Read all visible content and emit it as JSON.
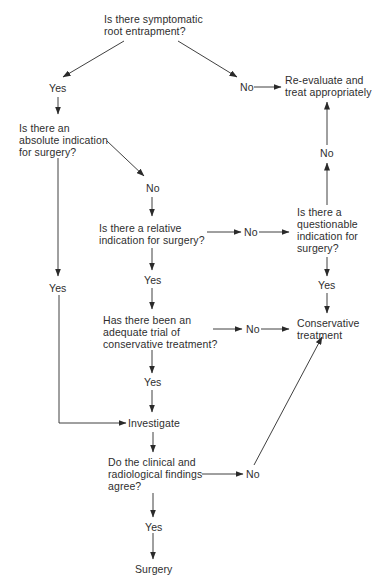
{
  "diagram": {
    "type": "flowchart",
    "nodes": {
      "q_root": {
        "lines": [
          "Is there symptomatic",
          "root entrapment?"
        ]
      },
      "yes_1": {
        "text": "Yes"
      },
      "no_1": {
        "text": "No"
      },
      "reevaluate": {
        "lines": [
          "Re-evaluate and",
          "treat appropriately"
        ]
      },
      "q_absolute": {
        "lines": [
          "Is there an",
          "absolute indication",
          "for surgery?"
        ]
      },
      "no_2": {
        "text": "No"
      },
      "yes_abs": {
        "text": "Yes"
      },
      "q_relative": {
        "lines": [
          "Is there a relative",
          "indication for surgery?"
        ]
      },
      "no_3": {
        "text": "No"
      },
      "q_questionable": {
        "lines": [
          "Is there a",
          "questionable",
          "indication for",
          "surgery?"
        ]
      },
      "no_q": {
        "text": "No"
      },
      "yes_q": {
        "text": "Yes"
      },
      "yes_rel": {
        "text": "Yes"
      },
      "q_trial": {
        "lines": [
          "Has there been an",
          "adequate trial of",
          "conservative treatment?"
        ]
      },
      "no_4": {
        "text": "No"
      },
      "conservative": {
        "lines": [
          "Conservative",
          "treatment"
        ]
      },
      "yes_trial": {
        "text": "Yes"
      },
      "investigate": {
        "text": "Investigate"
      },
      "q_agree": {
        "lines": [
          "Do the clinical and",
          "radiological findings",
          "agree?"
        ]
      },
      "no_5": {
        "text": "No"
      },
      "yes_agree": {
        "text": "Yes"
      },
      "surgery": {
        "text": "Surgery"
      }
    },
    "edges": [
      [
        "q_root",
        "yes_1"
      ],
      [
        "q_root",
        "no_1"
      ],
      [
        "no_1",
        "reevaluate"
      ],
      [
        "yes_1",
        "q_absolute"
      ],
      [
        "q_absolute",
        "no_2"
      ],
      [
        "q_absolute",
        "yes_abs"
      ],
      [
        "no_2",
        "q_relative"
      ],
      [
        "q_relative",
        "no_3"
      ],
      [
        "no_3",
        "q_questionable"
      ],
      [
        "q_questionable",
        "no_q"
      ],
      [
        "no_q",
        "reevaluate"
      ],
      [
        "q_questionable",
        "yes_q"
      ],
      [
        "yes_q",
        "conservative"
      ],
      [
        "q_relative",
        "yes_rel"
      ],
      [
        "yes_rel",
        "q_trial"
      ],
      [
        "q_trial",
        "no_4"
      ],
      [
        "no_4",
        "conservative"
      ],
      [
        "q_trial",
        "yes_trial"
      ],
      [
        "yes_trial",
        "investigate"
      ],
      [
        "yes_abs",
        "investigate"
      ],
      [
        "investigate",
        "q_agree"
      ],
      [
        "q_agree",
        "no_5"
      ],
      [
        "no_5",
        "conservative"
      ],
      [
        "q_agree",
        "yes_agree"
      ],
      [
        "yes_agree",
        "surgery"
      ]
    ],
    "colors": {
      "line": "#2a2a2a",
      "text": "#2e2e2e",
      "background": "#ffffff"
    }
  }
}
